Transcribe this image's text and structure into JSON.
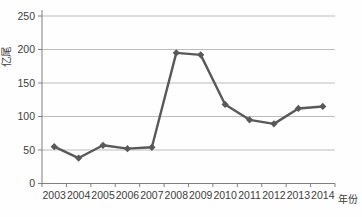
{
  "chart_data": {
    "type": "line",
    "title": "",
    "xlabel": "年份",
    "ylabel": "亿尾",
    "categories": [
      "2003",
      "2004",
      "2005",
      "2006",
      "2007",
      "2008",
      "2009",
      "2010",
      "2011",
      "2012",
      "2013",
      "2014"
    ],
    "series": [
      {
        "name": "",
        "values": [
          55,
          38,
          57,
          52,
          54,
          195,
          192,
          118,
          95,
          89,
          112,
          115
        ]
      }
    ],
    "ylim": [
      0,
      250
    ],
    "ytick_step": 50,
    "ytick_labels": [
      "0",
      "50",
      "100",
      "150",
      "200",
      "250"
    ],
    "grid": "horizontal",
    "legend_position": "none",
    "marker": "diamond",
    "line_color": "#595959",
    "marker_color": "#595959",
    "gridline_color": "#bdbdbd",
    "axis_color": "#7f7f7f",
    "text_color": "#3d3d3d",
    "background": "#fefefe"
  }
}
